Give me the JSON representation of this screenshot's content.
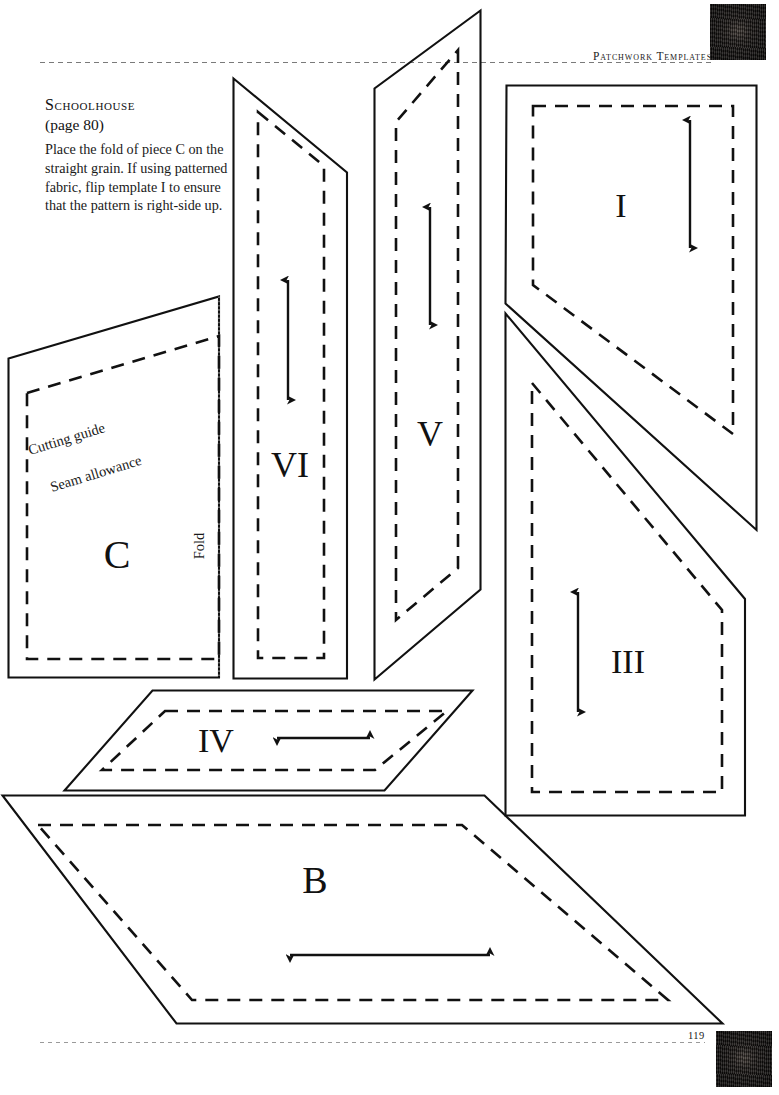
{
  "page": {
    "running_head": "Patchwork Templates",
    "folio": "119",
    "background_color": "#ffffff",
    "ink_color": "#1a1a1a"
  },
  "instructions": {
    "title": "Schoolhouse",
    "subtitle_prefix": "(",
    "subtitle": "(page 80)",
    "page_reference": "page 80",
    "body": "Place the fold of piece C on the straight grain. If using patterned fabric, flip template I to ensure that the pattern is right-side up."
  },
  "annotations": {
    "cutting_guide": "Cutting guide",
    "seam_allowance": "Seam allowance",
    "fold": "Fold"
  },
  "templates": [
    {
      "id": "C",
      "label": "C",
      "shape": "quadrilateral-with-fold",
      "grain_arrow": "none",
      "has_fold_edge": true,
      "annotations": [
        "Cutting guide",
        "Seam allowance",
        "Fold"
      ]
    },
    {
      "id": "VI",
      "label": "VI",
      "shape": "tall-angled-strip",
      "grain_arrow": "vertical-double",
      "has_fold_edge": false,
      "annotations": []
    },
    {
      "id": "V",
      "label": "V",
      "shape": "tall-angled-strip",
      "grain_arrow": "vertical-double",
      "has_fold_edge": false,
      "annotations": []
    },
    {
      "id": "I",
      "label": "I",
      "shape": "notched-pentagon",
      "grain_arrow": "vertical-double",
      "has_fold_edge": false,
      "annotations": []
    },
    {
      "id": "III",
      "label": "III",
      "shape": "notched-pentagon",
      "grain_arrow": "vertical-double",
      "has_fold_edge": false,
      "annotations": []
    },
    {
      "id": "IV",
      "label": "IV",
      "shape": "parallelogram",
      "grain_arrow": "horizontal-double",
      "has_fold_edge": false,
      "annotations": []
    },
    {
      "id": "B",
      "label": "B",
      "shape": "parallelogram",
      "grain_arrow": "horizontal-double",
      "has_fold_edge": false,
      "annotations": []
    }
  ],
  "swatches": [
    {
      "id": "top-right",
      "description": "quilted-fabric-detail",
      "color": "#161312"
    },
    {
      "id": "bottom-right",
      "description": "quilted-fabric-detail",
      "color": "#161312"
    }
  ]
}
